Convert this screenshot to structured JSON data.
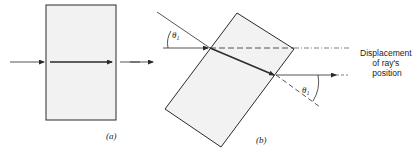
{
  "figure": {
    "panel_a": {
      "label": "(a)"
    },
    "panel_b": {
      "label": "(b)",
      "angle_label_incident": "θ",
      "angle_subscript_incident": "1",
      "angle_label_exit": "θ",
      "angle_subscript_exit": "1",
      "annotation_line1": "Displacement",
      "annotation_line2": "of ray's",
      "annotation_line3": "position"
    }
  },
  "colors": {
    "line": "#2a2a2a",
    "slab_fill": "#f2f2f2",
    "background": "#ffffff"
  }
}
